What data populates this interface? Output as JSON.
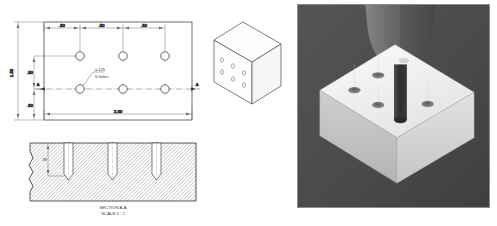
{
  "figure": {
    "kind": "engineering-drawing-and-render",
    "background": "#ffffff"
  },
  "drawing": {
    "top_view": {
      "name": "top-view",
      "horizontal_dimensions": [
        ".50",
        ".50",
        ".50"
      ],
      "vertical_dimensions": [
        "1.50",
        ".50",
        ".50"
      ],
      "overall_width_dimension": "2.00",
      "hole_callout_diameter": "⌀.125",
      "hole_callout_count": "6 holes",
      "section_marker_left": "A",
      "section_marker_right": "A",
      "hole_grid": {
        "columns": 3,
        "rows": 2,
        "hole_count": 6
      }
    },
    "section_view": {
      "name": "section-a-a",
      "title": "SECTION A-A",
      "scale": "SCALE 5 : 1",
      "depth_dimension": ".38",
      "hole_count": 3,
      "hatch_color": "#9a9a9a",
      "line_color": "#2b2b2b"
    },
    "isometric_view": {
      "name": "isometric-block",
      "hole_count": 6,
      "line_color": "#4a4a4a"
    }
  },
  "render": {
    "name": "drilling-simulation-render",
    "background_color": "#4a4a4a",
    "border_color": "#8c8c8c",
    "workpiece_color": "#f2f2f2",
    "workpiece_side_color": "#bdbdbd",
    "workpiece_front_color": "#d6d6d6",
    "drill_color": "#3d3d3d",
    "spindle_color": "#6b6b6b",
    "hole_count": 5,
    "caption": ""
  }
}
